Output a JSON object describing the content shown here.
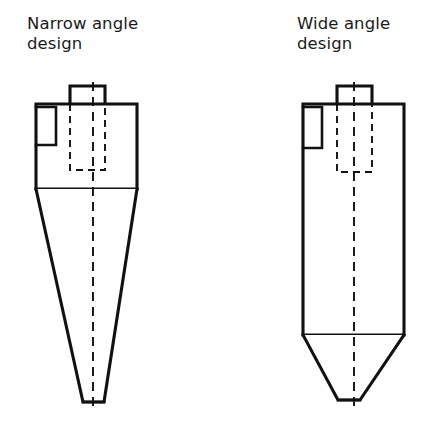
{
  "figure": {
    "background_color": "#ffffff",
    "line_color": "#111111",
    "text_color": "#1a1a1a",
    "width": 439,
    "height": 426
  },
  "designs": [
    {
      "id": "narrow-angle",
      "caption_line1": "Narrow angle",
      "caption_line2": "design",
      "caption_x": 27,
      "caption_y1": 29,
      "caption_y2": 49,
      "outlet_pipe": {
        "left": 70,
        "right": 105,
        "top": 86,
        "bottom": 104
      },
      "cylinder": {
        "left": 36,
        "right": 137,
        "top": 104,
        "bottom": 189
      },
      "inlet_box": {
        "left": 36,
        "right": 56,
        "top": 107,
        "bottom": 145
      },
      "cone": {
        "top": 189,
        "tip_left": 83,
        "tip_right": 104,
        "bottom": 402
      },
      "vortex_finder": {
        "left": 70,
        "right": 105,
        "top": 104,
        "bottom": 170
      },
      "centerline": {
        "x": 93,
        "top": 82,
        "bottom": 412
      }
    },
    {
      "id": "wide-angle",
      "caption_line1": "Wide angle",
      "caption_line2": "design",
      "caption_x": 297,
      "caption_y1": 29,
      "caption_y2": 49,
      "outlet_pipe": {
        "left": 337,
        "right": 372,
        "top": 86,
        "bottom": 104
      },
      "cylinder": {
        "left": 303,
        "right": 404,
        "top": 104,
        "bottom": 335
      },
      "inlet_box": {
        "left": 303,
        "right": 322,
        "top": 107,
        "bottom": 148
      },
      "cone": {
        "top": 335,
        "tip_left": 338,
        "tip_right": 360,
        "bottom": 400
      },
      "vortex_finder": {
        "left": 337,
        "right": 372,
        "top": 104,
        "bottom": 172
      },
      "centerline": {
        "x": 354,
        "top": 82,
        "bottom": 412
      }
    }
  ]
}
